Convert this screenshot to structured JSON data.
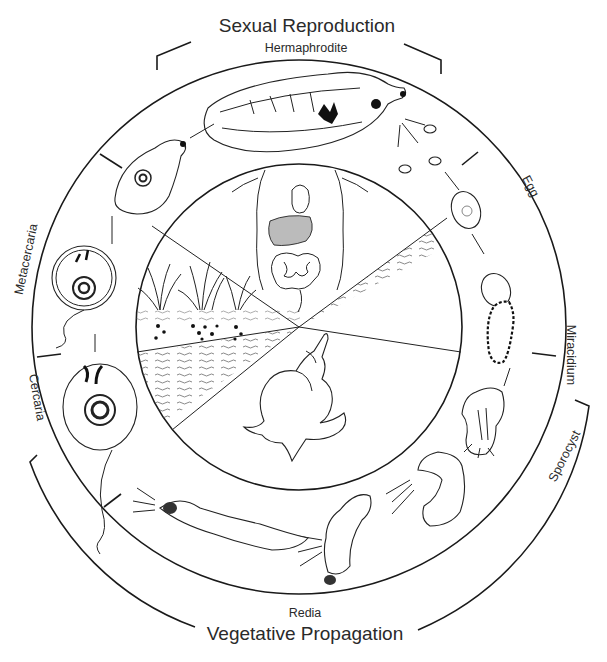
{
  "diagram": {
    "type": "life-cycle",
    "phases": {
      "top": "Sexual Reproduction",
      "bottom": "Vegetative Propagation"
    },
    "stages": [
      {
        "id": "hermaphrodite",
        "label": "Hermaphrodite",
        "position": "top"
      },
      {
        "id": "egg",
        "label": "Egg",
        "position": "upper-right"
      },
      {
        "id": "miracidium",
        "label": "Miracidium",
        "position": "right"
      },
      {
        "id": "sporocyst",
        "label": "Sporocyst",
        "position": "lower-right"
      },
      {
        "id": "redia",
        "label": "Redia",
        "position": "bottom"
      },
      {
        "id": "cercaria",
        "label": "Cercaria",
        "position": "left-lower"
      },
      {
        "id": "metacercaria",
        "label": "Metacercaria",
        "position": "left-upper"
      }
    ],
    "inner_sectors": [
      {
        "id": "host",
        "depiction": "human torso with liver and intestines"
      },
      {
        "id": "water-right",
        "depiction": "water"
      },
      {
        "id": "snail",
        "depiction": "snail (intermediate host)"
      },
      {
        "id": "water-left",
        "depiction": "water"
      },
      {
        "id": "plants",
        "depiction": "aquatic plants / watercress"
      }
    ]
  }
}
